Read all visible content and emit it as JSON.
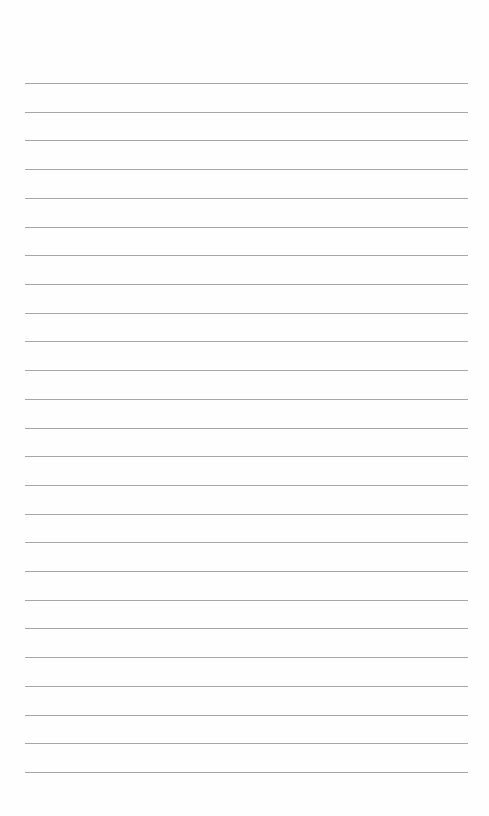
{
  "page": {
    "type": "lined-paper",
    "line_count": 25,
    "line_color": "#8a8a8a",
    "background_color": "#fefefe"
  }
}
